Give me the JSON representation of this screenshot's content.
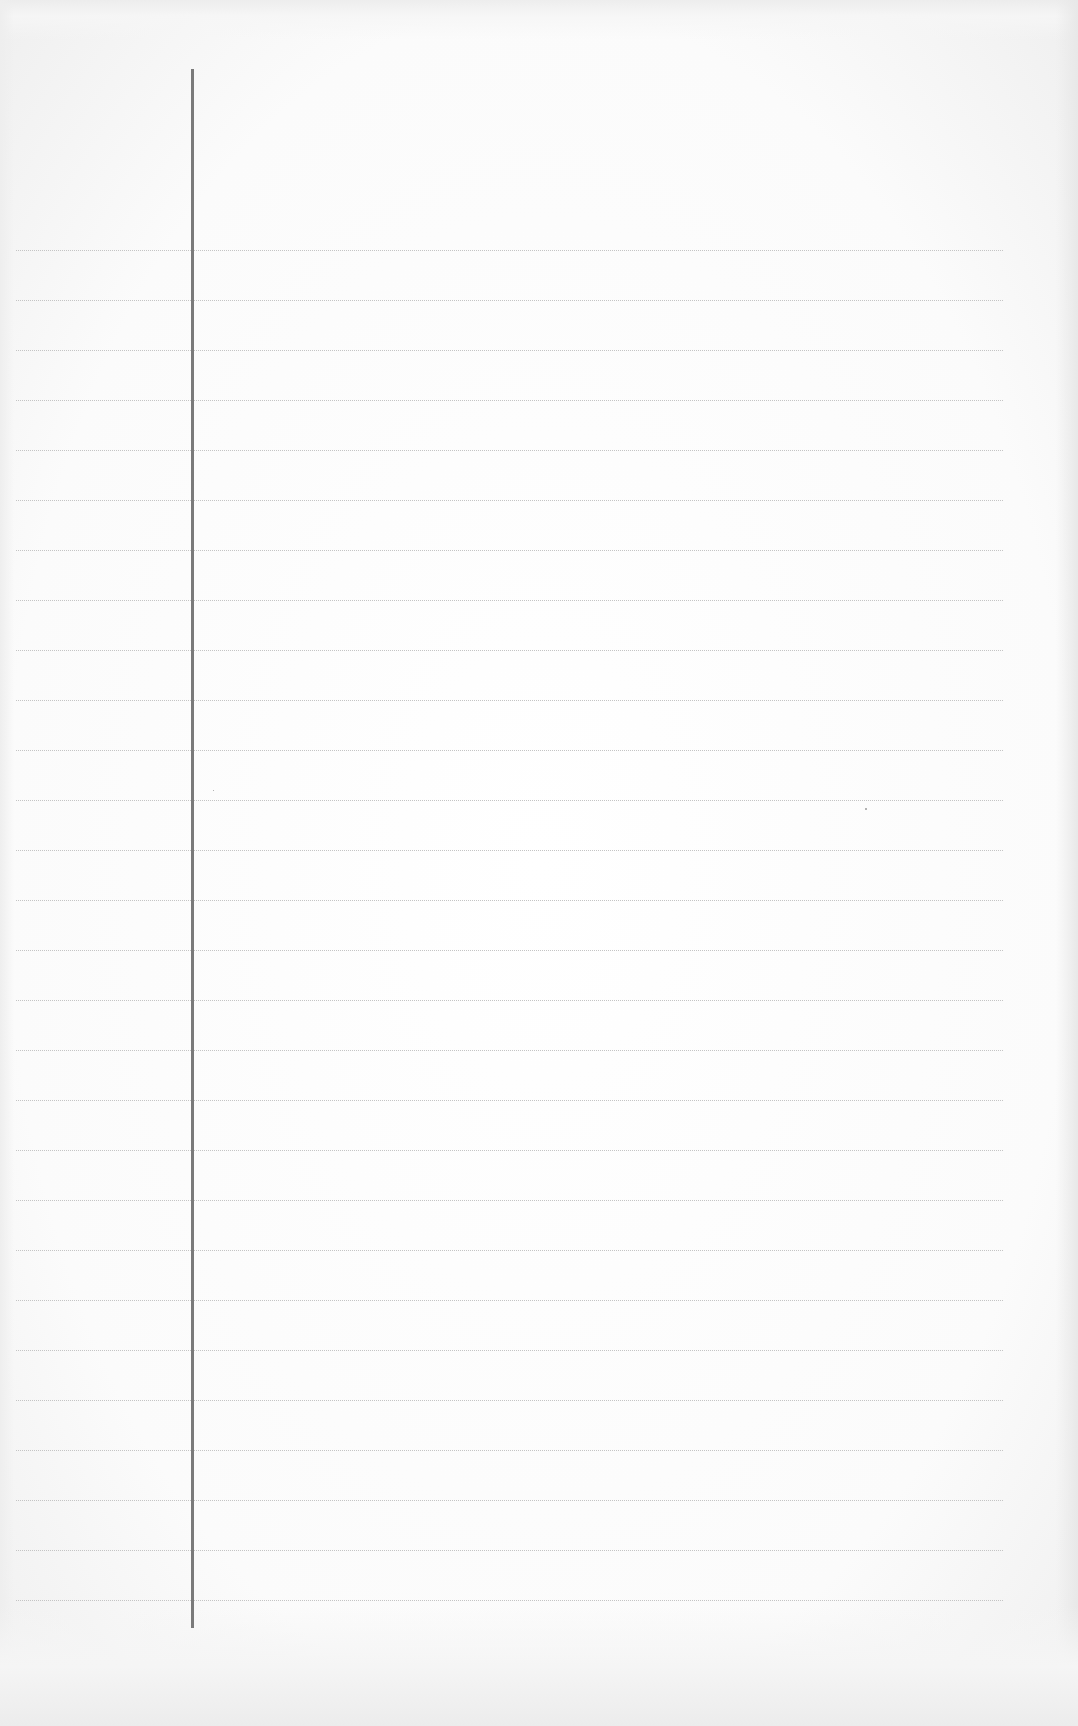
{
  "document": {
    "type": "lined-notebook-paper",
    "background_color": "#fdfdfd",
    "rule_color": "#c4c4c4",
    "margin_line_color": "#7a7a7a",
    "rules": {
      "count": 28,
      "first_y": 250,
      "spacing": 50,
      "left": 16,
      "right": 1003
    },
    "margin_line": {
      "x": 191,
      "top": 69,
      "bottom": 1628
    },
    "text_content": ""
  }
}
